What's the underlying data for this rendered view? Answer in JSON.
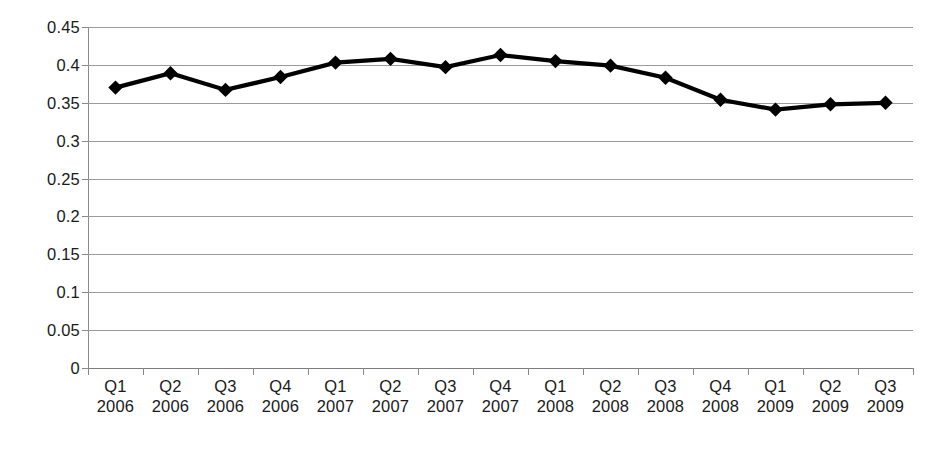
{
  "chart_data": {
    "type": "line",
    "title": "",
    "subtitle": "",
    "xlabel": "",
    "ylabel": "",
    "ylim": [
      0,
      0.45
    ],
    "grid": true,
    "legend": false,
    "legend_position": "none",
    "marker": "diamond",
    "series_color": "#000000",
    "gridline_color": "#9a9a9a",
    "axis_color": "#8a8a8a",
    "background_color": "#ffffff",
    "y_ticks": [
      "0",
      "0.05",
      "0.1",
      "0.15",
      "0.2",
      "0.25",
      "0.3",
      "0.35",
      "0.4",
      "0.45"
    ],
    "y_tick_values": [
      0,
      0.05,
      0.1,
      0.15,
      0.2,
      0.25,
      0.3,
      0.35,
      0.4,
      0.45
    ],
    "categories": [
      {
        "quarter": "Q1",
        "year": "2006"
      },
      {
        "quarter": "Q2",
        "year": "2006"
      },
      {
        "quarter": "Q3",
        "year": "2006"
      },
      {
        "quarter": "Q4",
        "year": "2006"
      },
      {
        "quarter": "Q1",
        "year": "2007"
      },
      {
        "quarter": "Q2",
        "year": "2007"
      },
      {
        "quarter": "Q3",
        "year": "2007"
      },
      {
        "quarter": "Q4",
        "year": "2007"
      },
      {
        "quarter": "Q1",
        "year": "2008"
      },
      {
        "quarter": "Q2",
        "year": "2008"
      },
      {
        "quarter": "Q3",
        "year": "2008"
      },
      {
        "quarter": "Q4",
        "year": "2008"
      },
      {
        "quarter": "Q1",
        "year": "2009"
      },
      {
        "quarter": "Q2",
        "year": "2009"
      },
      {
        "quarter": "Q3",
        "year": "2009"
      }
    ],
    "values": [
      0.37,
      0.389,
      0.367,
      0.384,
      0.403,
      0.408,
      0.397,
      0.413,
      0.405,
      0.399,
      0.383,
      0.354,
      0.341,
      0.348,
      0.35
    ]
  }
}
